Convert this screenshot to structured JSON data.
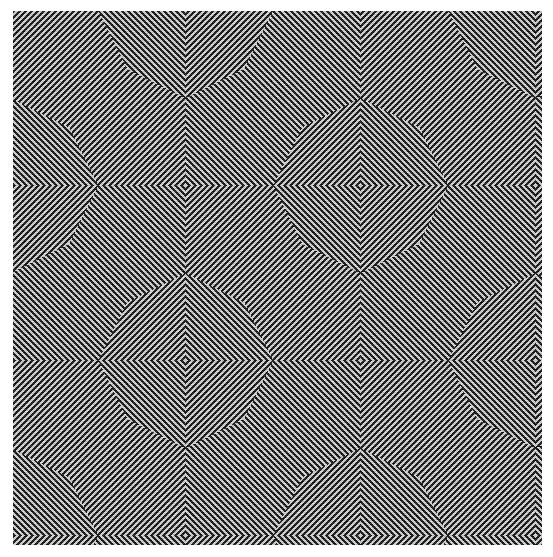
{
  "artwork": {
    "title": "Op-art concentric diamond zigzag pattern",
    "background": "#ffffff",
    "stripe_dark": "#2e2e2e",
    "stripe_light": "#d6d6d6",
    "bounds": {
      "x": 13,
      "y": 11,
      "width": 529,
      "height": 534
    },
    "stripe_period_px": 6,
    "diamond_centers": [
      {
        "x": 360,
        "y": 185
      },
      {
        "x": 190,
        "y": 366
      }
    ],
    "grid_spacing_px": 175
  }
}
